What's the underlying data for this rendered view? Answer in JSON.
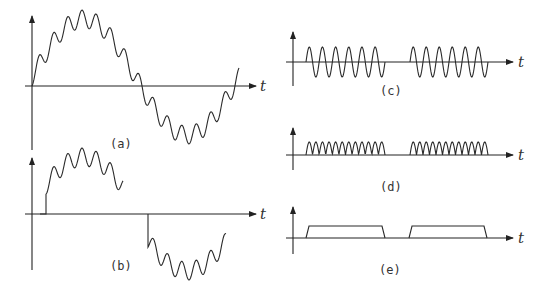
{
  "figure": {
    "panels": [
      {
        "id": "a",
        "label": "(a)",
        "axis_label": "t",
        "description": "Sine wave with superimposed high-frequency ripple (one full period)"
      },
      {
        "id": "b",
        "label": "(b)",
        "axis_label": "t",
        "description": "Gated/windowed rippled sine: positive half-burst, gap, negative half-burst"
      },
      {
        "id": "c",
        "label": "(c)",
        "axis_label": "t",
        "description": "Two bursts of a carrier sine wave (about 6 cycles each)"
      },
      {
        "id": "d",
        "label": "(d)",
        "axis_label": "t",
        "description": "Full-wave rectified bursts"
      },
      {
        "id": "e",
        "label": "(e)",
        "axis_label": "t",
        "description": "Envelope: two rectangular pulses"
      }
    ]
  },
  "colors": {
    "stroke": "#2a2a2a",
    "background": "#ffffff"
  }
}
